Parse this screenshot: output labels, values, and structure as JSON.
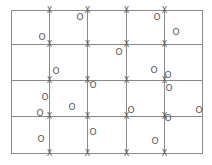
{
  "diagram": {
    "colors": {
      "background": "#ffffff",
      "grid_line": "#8a8a8a",
      "marker": "#555555"
    },
    "frame": {
      "left": 11,
      "top": 10,
      "right": 202,
      "bottom": 153
    },
    "vertical_lines_x": [
      49,
      87,
      126,
      164
    ],
    "horizontal_lines_y": [
      44,
      80,
      116
    ],
    "x_marker_symbol": "X",
    "o_marker_symbol": "O",
    "o_markers": [
      {
        "x": 80,
        "y": 17
      },
      {
        "x": 157,
        "y": 17
      },
      {
        "x": 176,
        "y": 32
      },
      {
        "x": 42,
        "y": 37
      },
      {
        "x": 119,
        "y": 52
      },
      {
        "x": 154,
        "y": 70
      },
      {
        "x": 56,
        "y": 71
      },
      {
        "x": 168,
        "y": 75
      },
      {
        "x": 93,
        "y": 85
      },
      {
        "x": 169,
        "y": 88
      },
      {
        "x": 45,
        "y": 97
      },
      {
        "x": 72,
        "y": 107
      },
      {
        "x": 131,
        "y": 110
      },
      {
        "x": 199,
        "y": 110
      },
      {
        "x": 40,
        "y": 113
      },
      {
        "x": 168,
        "y": 118
      },
      {
        "x": 93,
        "y": 132
      },
      {
        "x": 41,
        "y": 139
      },
      {
        "x": 155,
        "y": 141
      }
    ]
  }
}
